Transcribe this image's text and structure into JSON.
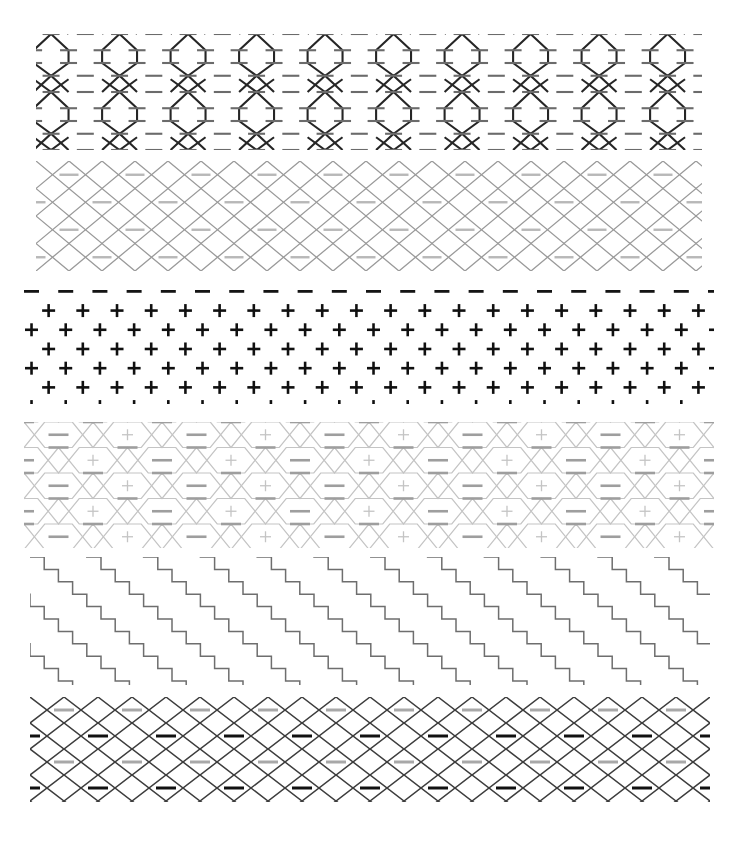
{
  "page": {
    "width": 737,
    "height": 842,
    "background": "#ffffff"
  },
  "palette": {
    "black": "#1a1a1a",
    "dark_gray": "#4d4d4d",
    "mid_gray": "#7a7a7a",
    "light_gray": "#b3b3b3",
    "pale_gray": "#c9c9c9",
    "white": "#ffffff"
  },
  "bands": [
    {
      "id": "band-1",
      "name": "hourglass-column-band",
      "label": "Band 1 — vertical hourglass columns with dashes",
      "motif": "hourglass-column",
      "x": 36,
      "y": 34,
      "width": 666,
      "height": 116,
      "stroke": "#262626",
      "dash_stroke": "#6b6b6b",
      "stroke_width": 2.1,
      "dash_width": 2.1,
      "repeat_x": 68.5,
      "repeat_y": 58,
      "columns": 10,
      "rows": 2,
      "dash_length": 17
    },
    {
      "id": "band-2",
      "name": "light-diamond-lattice-band",
      "label": "Band 2 — pale diamond lattice with centered dashes",
      "motif": "diamond-lattice",
      "x": 36,
      "y": 161,
      "width": 666,
      "height": 110,
      "stroke": "#9a9a9a",
      "dash_stroke": "#b8b8b8",
      "stroke_width": 1.3,
      "dash_width": 2.4,
      "repeat_x": 66,
      "repeat_y": 27.5,
      "columns": 11,
      "rows": 4,
      "dash_length": 19
    },
    {
      "id": "band-3",
      "name": "plus-sign-grid-band",
      "label": "Band 3 — staggered bold plus-sign grid with dash borders",
      "motif": "plus-grid",
      "x": 24,
      "y": 286,
      "width": 690,
      "height": 118,
      "stroke": "#101010",
      "dash_stroke": "#141414",
      "stroke_width": 2.6,
      "dash_width": 2.8,
      "repeat_x": 34.2,
      "repeat_y": 19.2,
      "columns": 21,
      "rows": 6,
      "plus_size": 13,
      "dash_length": 15
    },
    {
      "id": "band-4",
      "name": "pale-lattice-plus-band",
      "label": "Band 4 — faint diamond lattice with alternating dashes and plus signs",
      "motif": "lattice-plus",
      "x": 24,
      "y": 422,
      "width": 690,
      "height": 126,
      "stroke": "#c4c4c4",
      "dash_stroke": "#9e9e9e",
      "stroke_width": 1.2,
      "dash_width": 2.6,
      "repeat_x": 69,
      "repeat_y": 25.5,
      "columns": 10,
      "rows": 5,
      "dash_length": 20,
      "plus_size": 11
    },
    {
      "id": "band-5",
      "name": "staircase-band",
      "label": "Band 5 — diagonal staircase step lines",
      "motif": "staircase",
      "x": 30,
      "y": 557,
      "width": 680,
      "height": 128,
      "stroke": "#6e6e6e",
      "stroke_width": 1.5,
      "step_w": 14.2,
      "step_h": 12.4,
      "lines": 11,
      "steps_per_line": 50
    },
    {
      "id": "band-6",
      "name": "dark-diamond-lattice-band",
      "label": "Band 6 — dark diamond lattice with alternating light and dark dashes",
      "motif": "diamond-lattice-dark",
      "x": 30,
      "y": 697,
      "width": 680,
      "height": 105,
      "stroke": "#3d3d3d",
      "dash_stroke_light": "#a8a8a8",
      "dash_stroke_dark": "#111111",
      "stroke_width": 1.5,
      "dash_width": 3.0,
      "repeat_x": 68,
      "repeat_y": 26,
      "columns": 10,
      "rows": 4,
      "dash_length": 20
    }
  ]
}
